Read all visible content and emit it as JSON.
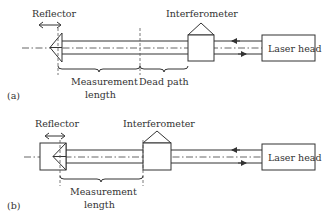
{
  "figure": {
    "panel_a": {
      "tag": "(a)",
      "reflector_label": "Reflector",
      "interferometer_label": "Interferometer",
      "laser_label": "Laser head",
      "measurement_label_line1": "Measurement",
      "measurement_label_line2": "length",
      "dead_path_label": "Dead path"
    },
    "panel_b": {
      "tag": "(b)",
      "reflector_label": "Reflector",
      "interferometer_label": "Interferometer",
      "laser_label": "Laser head",
      "measurement_label_line1": "Measurement",
      "measurement_label_line2": "length"
    },
    "colors": {
      "line": "#333333",
      "background": "#ffffff"
    }
  }
}
